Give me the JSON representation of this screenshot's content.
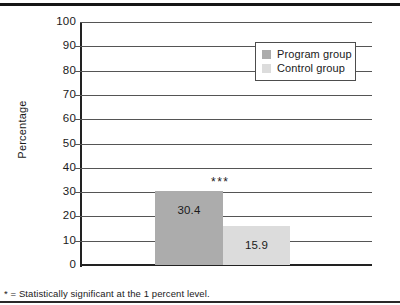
{
  "chart_data": {
    "type": "bar",
    "title": "",
    "subtitle": "",
    "xlabel": "",
    "ylabel": "Percentage",
    "ylim": [
      0,
      100
    ],
    "ytick_step": 10,
    "yticks": [
      100,
      90,
      80,
      70,
      60,
      50,
      40,
      30,
      20,
      10,
      0
    ],
    "ytick_labels": [
      "100",
      "90",
      "80",
      "70",
      "60",
      "50",
      "40",
      "30",
      "20",
      "10",
      "0"
    ],
    "grid": true,
    "grid_axis": "y",
    "categories": [
      ""
    ],
    "series": [
      {
        "name": "Program group",
        "values": [
          30.4
        ],
        "value_labels": [
          "30.4"
        ],
        "color": "#ACACAC"
      },
      {
        "name": "Control group",
        "values": [
          15.9
        ],
        "value_labels": [
          "15.9"
        ],
        "color": "#DCDCDC"
      }
    ],
    "legend": {
      "position": "top-right",
      "entries": [
        {
          "label": "Program group",
          "color": "#ACACAC"
        },
        {
          "label": "Control group",
          "color": "#DCDCDC"
        }
      ]
    },
    "annotations": [
      {
        "text": "***",
        "meaning": "Statistically significant at the 1 percent level",
        "x_position": "between-bars",
        "y_value": 34
      }
    ],
    "footnote": "* = Statistically significant at the 1 percent level."
  },
  "axis": {
    "y_title": "Percentage"
  },
  "bars": {
    "program": {
      "label": "30.4",
      "value": 30.4
    },
    "control": {
      "label": "15.9",
      "value": 15.9
    }
  },
  "legend": {
    "program_label": "Program group",
    "control_label": "Control group"
  },
  "marker": {
    "significance": "***"
  },
  "footnote": {
    "text": "* = Statistically significant at the 1 percent level."
  },
  "colors": {
    "program_bar": "#ACACAC",
    "control_bar": "#DCDCDC",
    "gridline": "#555555",
    "axis": "#222222",
    "rule": "#161616"
  }
}
